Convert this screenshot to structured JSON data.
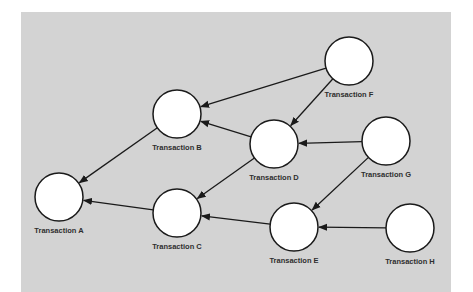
{
  "diagram": {
    "type": "directed-graph",
    "background_color": "#d3d3d3",
    "nodes": [
      {
        "id": "A",
        "label": "Transaction A",
        "cx": 59,
        "cy": 197
      },
      {
        "id": "B",
        "label": "Transaction B",
        "cx": 177,
        "cy": 114
      },
      {
        "id": "C",
        "label": "Transaction C",
        "cx": 177,
        "cy": 213
      },
      {
        "id": "D",
        "label": "Transaction D",
        "cx": 274,
        "cy": 144
      },
      {
        "id": "E",
        "label": "Transaction E",
        "cx": 294,
        "cy": 227
      },
      {
        "id": "F",
        "label": "Transaction F",
        "cx": 349,
        "cy": 61
      },
      {
        "id": "G",
        "label": "Transaction G",
        "cx": 386,
        "cy": 141
      },
      {
        "id": "H",
        "label": "Transaction H",
        "cx": 410,
        "cy": 228
      }
    ],
    "edges": [
      {
        "from": "B",
        "to": "A"
      },
      {
        "from": "C",
        "to": "A"
      },
      {
        "from": "F",
        "to": "B"
      },
      {
        "from": "D",
        "to": "B"
      },
      {
        "from": "D",
        "to": "C"
      },
      {
        "from": "E",
        "to": "C"
      },
      {
        "from": "F",
        "to": "D"
      },
      {
        "from": "G",
        "to": "D"
      },
      {
        "from": "G",
        "to": "E"
      },
      {
        "from": "H",
        "to": "E"
      }
    ]
  }
}
